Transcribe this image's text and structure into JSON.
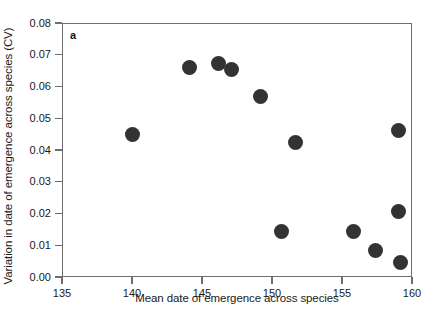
{
  "panel": {
    "label": "a"
  },
  "chart_data": {
    "type": "scatter",
    "title": "",
    "xlabel": "Mean date of emergence across species",
    "ylabel": "Variation in date of emergence across species (CV)",
    "xlim": [
      135,
      160
    ],
    "ylim": [
      0.0,
      0.08
    ],
    "xticks": [
      135,
      140,
      145,
      150,
      155,
      160
    ],
    "xticklabels": [
      "135",
      "140",
      "145",
      "150",
      "155",
      "160"
    ],
    "yticks": [
      0.0,
      0.01,
      0.02,
      0.03,
      0.04,
      0.05,
      0.06,
      0.07,
      0.08
    ],
    "yticklabels": [
      "0.00",
      "0.01",
      "0.02",
      "0.03",
      "0.04",
      "0.05",
      "0.06",
      "0.07",
      "0.08"
    ],
    "grid": false,
    "legend": null,
    "marker": "circle",
    "marker_color": "#333333",
    "points": [
      {
        "x": 140.0,
        "y": 0.045
      },
      {
        "x": 144.1,
        "y": 0.066
      },
      {
        "x": 146.2,
        "y": 0.0672
      },
      {
        "x": 147.1,
        "y": 0.0653
      },
      {
        "x": 149.2,
        "y": 0.057
      },
      {
        "x": 150.7,
        "y": 0.0142
      },
      {
        "x": 151.7,
        "y": 0.0425
      },
      {
        "x": 155.8,
        "y": 0.0142
      },
      {
        "x": 157.4,
        "y": 0.0085
      },
      {
        "x": 159.0,
        "y": 0.0462
      },
      {
        "x": 159.0,
        "y": 0.0205
      },
      {
        "x": 159.2,
        "y": 0.0045
      }
    ]
  }
}
